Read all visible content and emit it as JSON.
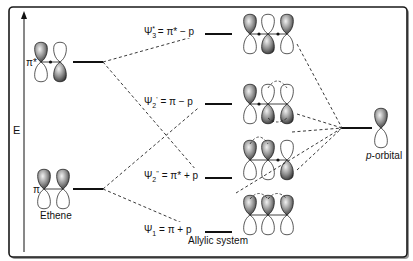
{
  "axis": {
    "label": "E"
  },
  "ethene": {
    "name": "Ethene",
    "pi_star_label": "π*",
    "pi_label": "π"
  },
  "allyl": {
    "name": "Allylic system",
    "levels": [
      {
        "id": "psi3",
        "label": "Ψ3* = π* − p",
        "symbol": "Ψ",
        "sub": "3",
        "sup": "*",
        "expr": " = π* − p"
      },
      {
        "id": "psi2p",
        "label": "Ψ2' = π − p",
        "symbol": "Ψ",
        "sub": "2",
        "sup": "'",
        "expr": " = π − p"
      },
      {
        "id": "psi2pp",
        "label": "Ψ2'' = π* + p",
        "symbol": "Ψ",
        "sub": "2",
        "sup": "''",
        "expr": " = π* + p"
      },
      {
        "id": "psi1",
        "label": "Ψ1 = π + p",
        "symbol": "Ψ",
        "sub": "1",
        "sup": "",
        "expr": " = π + p"
      }
    ]
  },
  "p_orbital": {
    "label_italic": "p",
    "label_rest": "-orbital"
  },
  "colors": {
    "line": "#111111",
    "lobe_fill": "#6e6e6e",
    "frame": "#1a1a1a"
  }
}
